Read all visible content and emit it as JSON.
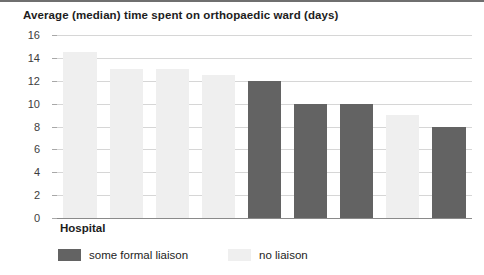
{
  "chart_data": {
    "type": "bar",
    "title": "Average (median) time spent on orthopaedic ward (days)",
    "xlabel": "Hospital",
    "ylabel": "",
    "ylim": [
      0,
      16
    ],
    "ytick_labels": [
      "16",
      "14",
      "12",
      "10",
      "8",
      "6",
      "4",
      "2",
      "0"
    ],
    "ytick_values": [
      16,
      14,
      12,
      10,
      8,
      6,
      4,
      2,
      0
    ],
    "grid": true,
    "legend_position": "bottom-left",
    "categories": [
      "1",
      "2",
      "3",
      "4",
      "5",
      "6",
      "7",
      "8",
      "9"
    ],
    "values": [
      14.5,
      13,
      13,
      12.5,
      12,
      10,
      10,
      9,
      8
    ],
    "groups": [
      "no liaison",
      "no liaison",
      "no liaison",
      "no liaison",
      "some formal liaison",
      "some formal liaison",
      "some formal liaison",
      "no liaison",
      "some formal liaison"
    ],
    "series": [
      {
        "name": "some formal liaison",
        "color": "#636363",
        "points": [
          {
            "category": "5",
            "value": 12
          },
          {
            "category": "6",
            "value": 10
          },
          {
            "category": "7",
            "value": 10
          },
          {
            "category": "9",
            "value": 8
          }
        ]
      },
      {
        "name": "no liaison",
        "color": "#efefef",
        "points": [
          {
            "category": "1",
            "value": 14.5
          },
          {
            "category": "2",
            "value": 13
          },
          {
            "category": "3",
            "value": 13
          },
          {
            "category": "4",
            "value": 12.5
          },
          {
            "category": "8",
            "value": 9
          }
        ]
      }
    ],
    "legend": [
      {
        "label": "some formal liaison",
        "color": "#636363"
      },
      {
        "label": "no liaison",
        "color": "#efefef"
      }
    ]
  }
}
